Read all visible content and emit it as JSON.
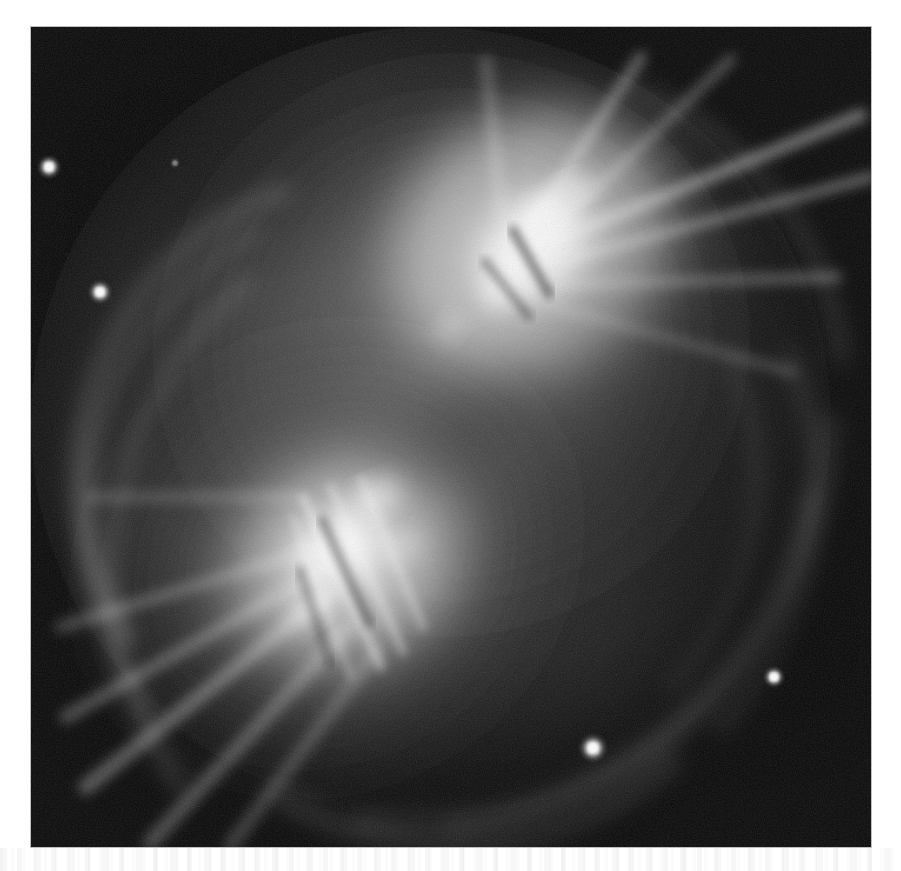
{
  "document": {
    "kind": "astronomical-plate",
    "medium": "grayscale photographic plate reproduction",
    "page_background": "#ffffff",
    "plate_background": "#060606"
  },
  "plate": {
    "x": 31,
    "y": 27,
    "width": 840,
    "height": 820,
    "caption": "",
    "sky_background_hex": "#070707"
  },
  "artifact": {
    "label": "scan-texture-band",
    "y": 848,
    "height": 23
  },
  "chart_data": {
    "type": "heatmap",
    "title": "",
    "subtitle": "",
    "xlabel": "",
    "ylabel": "",
    "colormap": "grayscale",
    "value_range": [
      0,
      255
    ],
    "grid": false,
    "legend": false,
    "axis_visible": false,
    "features": [
      {
        "name": "upper-lobe",
        "kind": "bright-lobe",
        "cx": 520,
        "cy": 230,
        "rx": 160,
        "ry": 150,
        "peak_value": 252,
        "note": "brightest knot, NE lobe"
      },
      {
        "name": "lower-lobe",
        "kind": "bright-lobe",
        "cx": 325,
        "cy": 545,
        "rx": 140,
        "ry": 150,
        "peak_value": 238,
        "note": "SW lobe, elongated NE-SW"
      },
      {
        "name": "halo",
        "kind": "diffuse-envelope",
        "cx": 400,
        "cy": 400,
        "rx": 330,
        "ry": 330,
        "peak_value": 120
      }
    ],
    "point_sources": [
      {
        "name": "star-1",
        "x": 49,
        "y": 167,
        "radius": 5.0,
        "peak_value": 235
      },
      {
        "name": "star-2",
        "x": 100,
        "y": 292,
        "radius": 5.0,
        "peak_value": 228
      },
      {
        "name": "star-3",
        "x": 774,
        "y": 677,
        "radius": 4.5,
        "peak_value": 222
      },
      {
        "name": "star-4",
        "x": 593,
        "y": 748,
        "radius": 6.0,
        "peak_value": 246
      },
      {
        "name": "star-5",
        "x": 175,
        "y": 163,
        "radius": 2.2,
        "peak_value": 110
      }
    ],
    "filaments": [
      {
        "name": "ray-ne-1",
        "angle_deg": 28,
        "length": 260
      },
      {
        "name": "ray-ne-2",
        "angle_deg": 40,
        "length": 240
      },
      {
        "name": "ray-ne-3",
        "angle_deg": 52,
        "length": 210
      },
      {
        "name": "ray-sw-1",
        "angle_deg": 214,
        "length": 280
      },
      {
        "name": "ray-sw-2",
        "angle_deg": 226,
        "length": 300
      },
      {
        "name": "ray-sw-3",
        "angle_deg": 238,
        "length": 260
      }
    ],
    "arcs": [
      {
        "name": "shell-arc-inner",
        "radius": 215,
        "peak_value": 95
      },
      {
        "name": "shell-arc-mid",
        "radius": 285,
        "peak_value": 78
      },
      {
        "name": "shell-arc-outer",
        "radius": 345,
        "peak_value": 58
      }
    ]
  }
}
